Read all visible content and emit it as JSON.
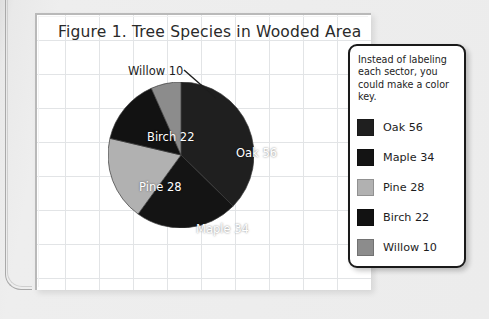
{
  "chart_data": {
    "type": "pie",
    "title": "Figure 1. Tree Species in Wooded Area",
    "xlabel": "",
    "ylabel": "",
    "legend_position": "right",
    "grid": true,
    "start_angle_deg": 0,
    "direction": "clockwise",
    "total": 150,
    "categories": [
      "Oak",
      "Maple",
      "Pine",
      "Birch",
      "Willow"
    ],
    "values": [
      56,
      34,
      28,
      22,
      10
    ],
    "labels": [
      "Oak 56",
      "Maple 34",
      "Pine 28",
      "Birch 22",
      "Willow 10"
    ],
    "colors": [
      "#1f1f1f",
      "#141414",
      "#b1b1b1",
      "#121212",
      "#8c8c8c"
    ],
    "slices": [
      {
        "name": "Oak",
        "value": 56,
        "label": "Oak 56",
        "color": "#1f1f1f",
        "label_color": "#ffffff",
        "percent": 37.3,
        "start_deg": 0.0,
        "end_deg": 134.4
      },
      {
        "name": "Maple",
        "value": 34,
        "label": "Maple 34",
        "color": "#141414",
        "label_color": "#ffffff",
        "percent": 22.7,
        "start_deg": 134.4,
        "end_deg": 216.0
      },
      {
        "name": "Pine",
        "value": 28,
        "label": "Pine 28",
        "color": "#b1b1b1",
        "label_color": "#ffffff",
        "percent": 18.7,
        "start_deg": 216.0,
        "end_deg": 283.2
      },
      {
        "name": "Birch",
        "value": 22,
        "label": "Birch 22",
        "color": "#121212",
        "label_color": "#ffffff",
        "percent": 14.7,
        "start_deg": 283.2,
        "end_deg": 336.0
      },
      {
        "name": "Willow",
        "value": 10,
        "label": "Willow 10",
        "color": "#8c8c8c",
        "label_color": "#1d1d1d",
        "percent": 6.7,
        "start_deg": 336.0,
        "end_deg": 360.0
      }
    ],
    "annotations": [
      {
        "text": "Willow 10",
        "target": "Willow",
        "leader_line": true
      }
    ]
  },
  "legend": {
    "note": "Instead of labeling each sector, you could make a color key.",
    "items": [
      {
        "label": "Oak 56",
        "color": "#1f1f1f"
      },
      {
        "label": "Maple 34",
        "color": "#141414"
      },
      {
        "label": "Pine 28",
        "color": "#b1b1b1"
      },
      {
        "label": "Birch 22",
        "color": "#121212"
      },
      {
        "label": "Willow 10",
        "color": "#8c8c8c"
      }
    ]
  },
  "page": {
    "card_background": "#ffffff",
    "grid_line_color": "#e2e4e6",
    "backdrop_color": "#e8e8e8"
  }
}
